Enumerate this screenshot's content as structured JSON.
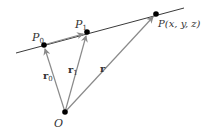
{
  "diagram": {
    "type": "vector-line-diagram",
    "colors": {
      "line": "#3a3a3a",
      "vector": "#8a8a8a",
      "point": "#000000",
      "text": "#333333"
    },
    "line": {
      "x1": 16,
      "y1": 53,
      "x2": 184,
      "y2": 8
    },
    "points": {
      "P0": {
        "x": 44,
        "y": 45,
        "label": "P",
        "sub": "0"
      },
      "P1": {
        "x": 87,
        "y": 32,
        "label": "P",
        "sub": "1"
      },
      "P": {
        "x": 156,
        "y": 14,
        "label": "P(x, y, z)"
      },
      "O": {
        "x": 65,
        "y": 112,
        "label": "O"
      }
    },
    "vectors": {
      "r0": {
        "label": "r",
        "sub": "0"
      },
      "r1": {
        "label": "r",
        "sub": "1"
      },
      "r": {
        "label": "r"
      }
    }
  }
}
